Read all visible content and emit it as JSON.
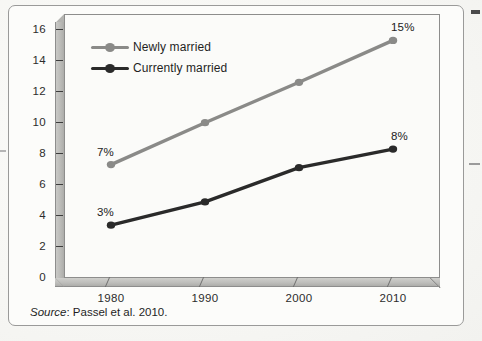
{
  "figure": {
    "source_prefix": "Source",
    "source_text": ": Passel et al. 2010."
  },
  "colors": {
    "newly_married": "#8a8a88",
    "currently_married": "#2a2a2a",
    "axis": "#3d3d3d",
    "frame": "#9a9a99",
    "wall": "#b9b9b6",
    "floor": "#bdbdba"
  },
  "legend": {
    "position": "inside-top-left",
    "items": [
      {
        "label": "Newly married",
        "color": "#8a8a88"
      },
      {
        "label": "Currently married",
        "color": "#2a2a2a"
      }
    ]
  },
  "chart_data": {
    "type": "line",
    "title": "",
    "subtitle": "",
    "xlabel": "",
    "ylabel": "",
    "categories": [
      "1980",
      "1990",
      "2000",
      "2010"
    ],
    "x": [
      1980,
      1990,
      2000,
      2010
    ],
    "xlim": [
      1975,
      2015
    ],
    "ylim": [
      0,
      17
    ],
    "yticks": [
      0,
      2,
      4,
      6,
      8,
      10,
      12,
      14,
      16
    ],
    "ytick_labels": [
      "0",
      "2",
      "4",
      "6",
      "8",
      "10",
      "12",
      "14",
      "16"
    ],
    "xtick_labels": [
      "1980",
      "1990",
      "2000",
      "2010"
    ],
    "grid": false,
    "series": [
      {
        "name": "Newly married",
        "color": "#8a8a88",
        "values": [
          7.3,
          10.0,
          12.6,
          15.3
        ],
        "point_labels": [
          "7%",
          "",
          "",
          "15%"
        ]
      },
      {
        "name": "Currently married",
        "color": "#2a2a2a",
        "values": [
          3.4,
          4.9,
          7.1,
          8.3
        ],
        "point_labels": [
          "3%",
          "",
          "",
          "8%"
        ]
      }
    ],
    "annotations": [
      {
        "text": "7%",
        "series": "Newly married",
        "x": 1980,
        "y": 7.3
      },
      {
        "text": "15%",
        "series": "Newly married",
        "x": 2010,
        "y": 15.3
      },
      {
        "text": "3%",
        "series": "Currently married",
        "x": 1980,
        "y": 3.4
      },
      {
        "text": "8%",
        "series": "Currently married",
        "x": 2010,
        "y": 8.3
      }
    ]
  }
}
